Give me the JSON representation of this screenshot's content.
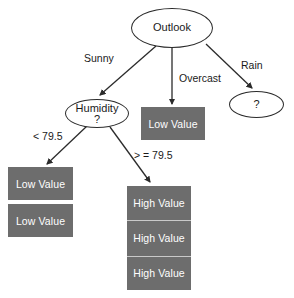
{
  "diagram": {
    "type": "decision-tree",
    "background_color": "#ffffff",
    "leaf_fill_color": "#6d6d6d",
    "leaf_text_color": "#ffffff",
    "stroke_color": "#2b2b2b"
  },
  "nodes": {
    "root": {
      "label": "Outlook"
    },
    "humidity": {
      "label": "Humidity",
      "sublabel": "?"
    },
    "unknown_rain": {
      "label": "?"
    },
    "overcast_leaf": {
      "label": "Low Value"
    },
    "low_leaf_1": {
      "label": "Low Value"
    },
    "low_leaf_2": {
      "label": "Low Value"
    },
    "high_leaf_1": {
      "label": "High Value"
    },
    "high_leaf_2": {
      "label": "High Value"
    },
    "high_leaf_3": {
      "label": "High Value"
    }
  },
  "edges": {
    "sunny": "Sunny",
    "overcast": "Overcast",
    "rain": "Rain",
    "humidity_low": "< 79.5",
    "humidity_high": "> = 79.5"
  }
}
